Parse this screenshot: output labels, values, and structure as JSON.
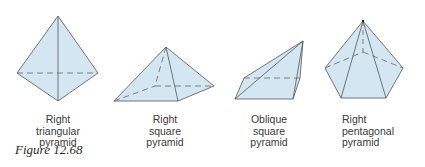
{
  "figure": {
    "caption": "Figure 12.68",
    "colors": {
      "face_fill": "#d5e6f3",
      "edge": "#555555",
      "hidden_edge": "#666666",
      "label_text": "#3a3a3a"
    },
    "pyramids": [
      {
        "name": "right-triangular-pyramid",
        "label_lines": [
          "Right",
          "triangular",
          "pyramid"
        ]
      },
      {
        "name": "right-square-pyramid",
        "label_lines": [
          "Right",
          "square",
          "pyramid"
        ]
      },
      {
        "name": "oblique-square-pyramid",
        "label_lines": [
          "Oblique",
          "square",
          "pyramid"
        ]
      },
      {
        "name": "right-pentagonal-pyramid",
        "label_lines": [
          "Right",
          "pentagonal",
          "pyramid"
        ]
      }
    ]
  }
}
